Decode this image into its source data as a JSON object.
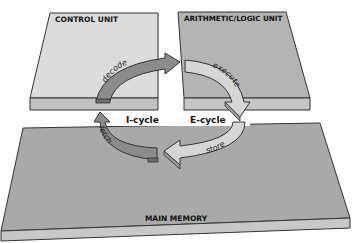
{
  "diagram": {
    "blocks": {
      "control_unit": "CONTROL UNIT",
      "alu": "ARITHMETIC/LOGIC UNIT",
      "main_memory": "MAIN MEMORY"
    },
    "cycles": {
      "i_cycle": "I-cycle",
      "e_cycle": "E-cycle"
    },
    "steps": {
      "fetch": "fetch",
      "decode": "decode",
      "execute": "execute",
      "store": "store"
    },
    "colors": {
      "block_top": "#dcdcdc",
      "block_side": "#b9b9b9",
      "memory_top": "#a9a9a9",
      "memory_side": "#c8c8c8",
      "arrow_dark": "#8c8c8c",
      "arrow_light": "#d6d6d6",
      "outline": "#333333"
    }
  }
}
